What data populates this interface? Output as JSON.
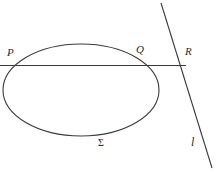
{
  "figure": {
    "background_color": "#ffffff",
    "stroke_color": "#3a3a3a",
    "label_color": "#2b2b2b",
    "width": 219,
    "height": 173,
    "labels": {
      "p": "P",
      "q": "Q",
      "r": "R",
      "sigma": "Σ",
      "line_l": "l"
    },
    "shapes": {
      "ellipse": {
        "name": "conic-sigma",
        "cx": 81,
        "cy": 90,
        "rx": 78,
        "ry": 46
      },
      "secant_line": {
        "name": "horizontal-secant",
        "x1": 0,
        "y1": 65,
        "x2": 186,
        "y2": 65
      },
      "transversal_line": {
        "name": "slanted-line-l",
        "x1": 161,
        "y1": 3,
        "x2": 212,
        "y2": 168
      }
    },
    "points": {
      "p": {
        "x": 11,
        "y": 65
      },
      "q": {
        "x": 148,
        "y": 65
      },
      "r": {
        "x": 180,
        "y": 65
      }
    }
  }
}
